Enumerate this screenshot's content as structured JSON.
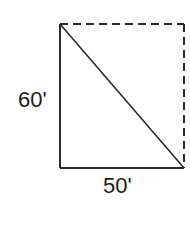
{
  "diagram": {
    "type": "right-triangle-in-rectangle",
    "height_label": "60'",
    "width_label": "50'",
    "height_value_ft": 60,
    "width_value_ft": 50,
    "colors": {
      "stroke": "#2a2a2a",
      "background": "#ffffff"
    },
    "edges": {
      "left": "solid",
      "bottom": "solid",
      "diagonal": "solid",
      "top": "dashed",
      "right": "dashed"
    }
  }
}
